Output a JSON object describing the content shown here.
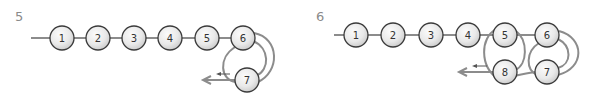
{
  "colors": {
    "edge": "#8c8c8c",
    "node_stroke": "#3a3a3a",
    "node_fill_light": "#fbfbfb",
    "node_fill_dark": "#cfcfcf",
    "label": "#8a8a8a"
  },
  "panels": [
    {
      "label": "5",
      "nodes": [
        {
          "id": "1",
          "label": "1"
        },
        {
          "id": "2",
          "label": "2"
        },
        {
          "id": "3",
          "label": "3"
        },
        {
          "id": "4",
          "label": "4"
        },
        {
          "id": "5",
          "label": "5"
        },
        {
          "id": "6",
          "label": "6"
        },
        {
          "id": "7",
          "label": "7"
        }
      ],
      "edges": [
        [
          "start",
          "1"
        ],
        [
          "1",
          "2"
        ],
        [
          "2",
          "3"
        ],
        [
          "3",
          "4"
        ],
        [
          "4",
          "5"
        ],
        [
          "5",
          "6"
        ],
        [
          "6",
          "7"
        ],
        [
          "6",
          "7"
        ],
        [
          "6",
          "exit"
        ]
      ],
      "exit_arrow": "left"
    },
    {
      "label": "6",
      "nodes": [
        {
          "id": "1",
          "label": "1"
        },
        {
          "id": "2",
          "label": "2"
        },
        {
          "id": "3",
          "label": "3"
        },
        {
          "id": "4",
          "label": "4"
        },
        {
          "id": "5",
          "label": "5"
        },
        {
          "id": "6",
          "label": "6"
        },
        {
          "id": "7",
          "label": "7"
        },
        {
          "id": "8",
          "label": "8"
        }
      ],
      "edges": [
        [
          "start",
          "1"
        ],
        [
          "1",
          "2"
        ],
        [
          "2",
          "3"
        ],
        [
          "3",
          "4"
        ],
        [
          "4",
          "5"
        ],
        [
          "5",
          "6"
        ],
        [
          "6",
          "7"
        ],
        [
          "6",
          "7"
        ],
        [
          "7",
          "8"
        ],
        [
          "5",
          "8"
        ],
        [
          "5",
          "8"
        ],
        [
          "8",
          "exit"
        ]
      ],
      "exit_arrow": "left"
    }
  ]
}
